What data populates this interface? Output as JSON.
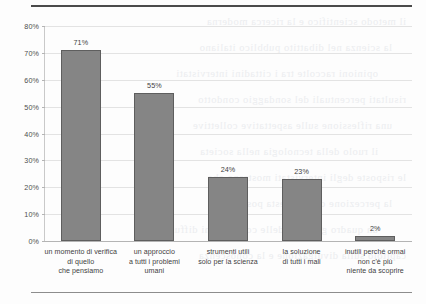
{
  "chart_data": {
    "type": "bar",
    "title": "",
    "subtitle": "",
    "xlabel": "",
    "ylabel": "",
    "ylim": [
      0,
      80
    ],
    "ytick_labels": [
      "0%",
      "10%",
      "20%",
      "30%",
      "40%",
      "50%",
      "60%",
      "70%",
      "80%"
    ],
    "ytick_values": [
      0,
      10,
      20,
      30,
      40,
      50,
      60,
      70,
      80
    ],
    "grid": true,
    "legend": false,
    "bar_color": "#858585",
    "bar_border_color": "#5e5e5e",
    "categories": [
      "un momento di verifica di quello che pensiamo",
      "un approccio a tutti i problemi umani",
      "strumenti utili solo per la scienza",
      "la soluzione di tutti i mali",
      "inutili perché ormai non c'è più niente da scoprire"
    ],
    "category_lines": [
      [
        "un momento di verifica",
        "di quello",
        "che pensiamo"
      ],
      [
        "un approccio",
        "a tutti i problemi",
        "umani"
      ],
      [
        "strumenti utili",
        "solo per la scienza"
      ],
      [
        "la soluzione",
        "di tutti i mali"
      ],
      [
        "inutili perché ormai",
        "non c'è più",
        "niente da scoprire"
      ]
    ],
    "values": [
      71,
      55,
      24,
      23,
      2
    ],
    "value_labels": [
      "71%",
      "55%",
      "24%",
      "23%",
      "2%"
    ]
  },
  "page": {
    "background_color": "#fdfdfd",
    "rule_top_color": "#4a4a4a",
    "rule_bottom_color": "#8d8d8d",
    "bleed_lines": [
      "il metodo scientifico e la ricerca moderna",
      "la scienza nel dibattito pubblico italiano",
      "opinioni raccolte tra i cittadini intervistati",
      "risultati percentuali del sondaggio condotto",
      "una riflessione sulle aspettative collettive",
      "il ruolo della tecnologia nella societa",
      "le risposte degli intervistati mostrano che",
      "la percezione diffusa resta positiva ma",
      "un quadro generale delle convinzioni diffuse",
      "capitolo sulla divulgazione e la conoscenza"
    ]
  }
}
